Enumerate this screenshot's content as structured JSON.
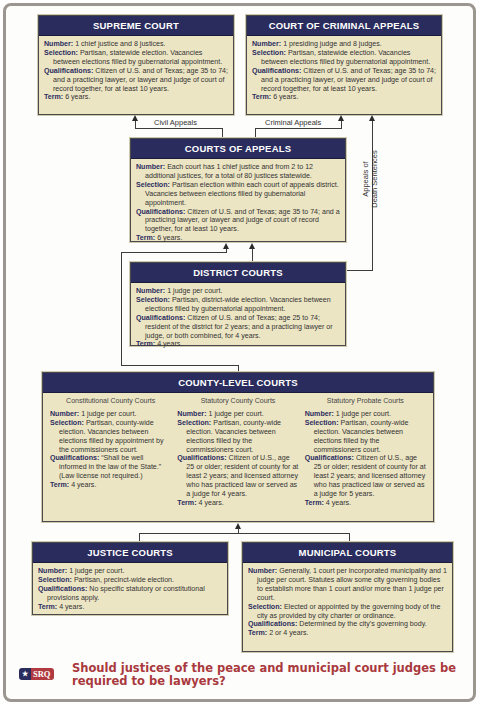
{
  "supreme_court": {
    "title": "SUPREME COURT",
    "number_label": "Number:",
    "number": " 1 chief justice and 8 justices.",
    "selection_label": "Selection:",
    "selection": " Partisan, statewide election. Vacancies between elections filled by gubernatorial appointment.",
    "qualifications_label": "Qualifications:",
    "qualifications": " Citizen of U.S. and of Texas; age 35 to 74; and a practicing lawyer, or lawyer and judge of court of record together, for at least 10 years.",
    "term_label": "Term:",
    "term": " 6 years."
  },
  "criminal_appeals": {
    "title": "COURT OF CRIMINAL APPEALS",
    "number_label": "Number:",
    "number": " 1 presiding judge and 8 judges.",
    "selection_label": "Selection:",
    "selection": " Partisan, statewide election. Vacancies between elections filled by gubernatorial appointment.",
    "qualifications_label": "Qualifications:",
    "qualifications": " Citizen of U.S. and of Texas; age 35 to 74; and a practicing lawyer, or lawyer and judge of court of record together, for at least 10 years.",
    "term_label": "Term:",
    "term": " 6 years."
  },
  "connectors": {
    "civil_appeals": "Civil Appeals",
    "criminal_appeals": "Criminal Appeals",
    "death_line1": "Appeals of",
    "death_line2": "Death Sentences"
  },
  "courts_of_appeals": {
    "title": "COURTS OF APPEALS",
    "number_label": "Number:",
    "number": " Each court has 1 chief justice and from 2 to 12 additional justices, for a total of 80 justices statewide.",
    "selection_label": "Selection:",
    "selection": " Partisan election within each court of appeals district. Vacancies between elections filled by gubernatorial appointment.",
    "qualifications_label": "Qualifications:",
    "qualifications": " Citizen of U.S. and of Texas; age 35 to 74; and a practicing lawyer, or lawyer and judge of court of record together, for at least 10 years.",
    "term_label": "Term:",
    "term": " 6 years."
  },
  "district_courts": {
    "title": "DISTRICT COURTS",
    "number_label": "Number:",
    "number": " 1 judge per court.",
    "selection_label": "Selection:",
    "selection": " Partisan, district-wide election. Vacancies between elections filled by gubernatorial appointment.",
    "qualifications_label": "Qualifications:",
    "qualifications": " Citizen of U.S. and of Texas; age 25 to 74; resident of the district for 2 years; and a practicing lawyer or judge, or both combined, for 4 years.",
    "term_label": "Term:",
    "term": " 4 years."
  },
  "county_level": {
    "title": "COUNTY-LEVEL COURTS",
    "columns": [
      {
        "subtitle": "Constitutional County Courts",
        "number_label": "Number:",
        "number": " 1 judge per court.",
        "selection_label": "Selection:",
        "selection": " Partisan, county-wide election. Vacancies between elections filled by appointment by the commissioners court.",
        "qualifications_label": "Qualifications:",
        "qualifications": " “Shall be well informed in the law of the State.” (Law license not required.)",
        "term_label": "Term:",
        "term": " 4 years."
      },
      {
        "subtitle": "Statutory County Courts",
        "number_label": "Number:",
        "number": " 1 judge per court.",
        "selection_label": "Selection:",
        "selection": " Partisan, county-wide election. Vacancies between elections filled by the commissioners court.",
        "qualifications_label": "Qualifications:",
        "qualifications": " Citizen of U.S., age 25 or older; resident of county for at least 2 years; and licensed attorney who has practiced law or served as a judge for 4 years.",
        "term_label": "Term:",
        "term": " 4 years."
      },
      {
        "subtitle": "Statutory Probate Courts",
        "number_label": "Number:",
        "number": " 1 judge per court.",
        "selection_label": "Selection:",
        "selection": " Partisan, county-wide election. Vacancies between elections filled by the commissioners court.",
        "qualifications_label": "Qualifications:",
        "qualifications": " Citizen of U.S., age 25 or older; resident of county for at least 2 years; and licensed attorney who has practiced law or served as a judge for 5 years.",
        "term_label": "Term:",
        "term": " 4 years."
      }
    ]
  },
  "justice_courts": {
    "title": "JUSTICE COURTS",
    "number_label": "Number:",
    "number": " 1 judge per court.",
    "selection_label": "Selection:",
    "selection": " Partisan, precinct-wide election.",
    "qualifications_label": "Qualifications:",
    "qualifications": " No specific statutory or constitutional provisions apply.",
    "term_label": "Term:",
    "term": " 4 years."
  },
  "municipal_courts": {
    "title": "MUNICIPAL COURTS",
    "number_label": "Number:",
    "number": " Generally, 1 court per incorporated municipality and 1 judge per court. Statutes allow some city governing bodies to establish more than 1 court and/or more than 1 judge per court.",
    "selection_label": "Selection:",
    "selection": " Elected or appointed by the governing body of the city as provided by city charter or ordinance.",
    "qualifications_label": "Qualifications:",
    "qualifications": " Determined by the city's governing body.",
    "term_label": "Term:",
    "term": " 2 or 4 years."
  },
  "srq": {
    "star": "★",
    "badge": "SRQ",
    "question": "Should justices of the peace and municipal court judges be required to be lawyers?"
  },
  "colors": {
    "header_navy": "#2b2c5e",
    "box_fill": "#ece5c4",
    "question_red": "#a9393d",
    "frame_gray": "#9b9790"
  }
}
